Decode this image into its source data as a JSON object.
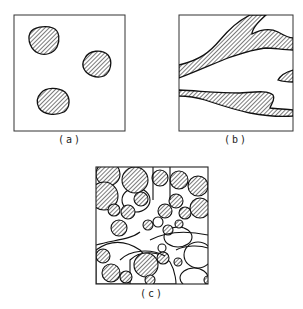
{
  "figure": {
    "panels": [
      {
        "id": "a",
        "label": "(a)",
        "description": "isolated particles"
      },
      {
        "id": "b",
        "label": "(b)",
        "description": "elongated interconnected phase"
      },
      {
        "id": "c",
        "label": "(c)",
        "description": "packed particles"
      }
    ],
    "colors": {
      "stroke": "#1a1a1a",
      "hatch": "#333333",
      "background": "#ffffff"
    }
  }
}
